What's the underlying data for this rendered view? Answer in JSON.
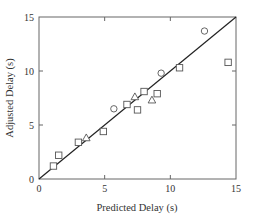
{
  "chart_data": {
    "type": "scatter",
    "title": "",
    "xlabel": "Predicted Delay (s)",
    "ylabel": "Adjusted Delay (s)",
    "xlim": [
      0,
      15
    ],
    "ylim": [
      0,
      15
    ],
    "xticks": [
      0,
      5,
      10,
      15
    ],
    "yticks": [
      0,
      5,
      10,
      15
    ],
    "grid": false,
    "legend": null,
    "reference_line": {
      "label": "y = x",
      "from": [
        0,
        0
      ],
      "to": [
        15,
        15
      ]
    },
    "series": [
      {
        "name": "squares",
        "marker": "square",
        "points": [
          {
            "x": 1.1,
            "y": 1.2
          },
          {
            "x": 1.5,
            "y": 2.2
          },
          {
            "x": 3.0,
            "y": 3.4
          },
          {
            "x": 4.9,
            "y": 4.4
          },
          {
            "x": 6.7,
            "y": 6.9
          },
          {
            "x": 7.5,
            "y": 6.4
          },
          {
            "x": 8.0,
            "y": 8.1
          },
          {
            "x": 9.0,
            "y": 7.9
          },
          {
            "x": 10.7,
            "y": 10.3
          },
          {
            "x": 14.4,
            "y": 10.8
          }
        ]
      },
      {
        "name": "triangles",
        "marker": "triangle",
        "points": [
          {
            "x": 3.6,
            "y": 3.8
          },
          {
            "x": 7.3,
            "y": 7.6
          },
          {
            "x": 8.6,
            "y": 7.3
          }
        ]
      },
      {
        "name": "circles",
        "marker": "circle",
        "points": [
          {
            "x": 5.7,
            "y": 6.5
          },
          {
            "x": 9.3,
            "y": 9.8
          },
          {
            "x": 12.6,
            "y": 13.7
          }
        ]
      }
    ]
  },
  "labels": {
    "xlabel": "Predicted Delay (s)",
    "ylabel": "Adjusted Delay (s)",
    "xticks": [
      "0",
      "5",
      "10",
      "15"
    ],
    "yticks": [
      "0",
      "5",
      "10",
      "15"
    ]
  },
  "colors": {
    "axis": "#555555",
    "marker": "#555555",
    "line": "#222222"
  }
}
